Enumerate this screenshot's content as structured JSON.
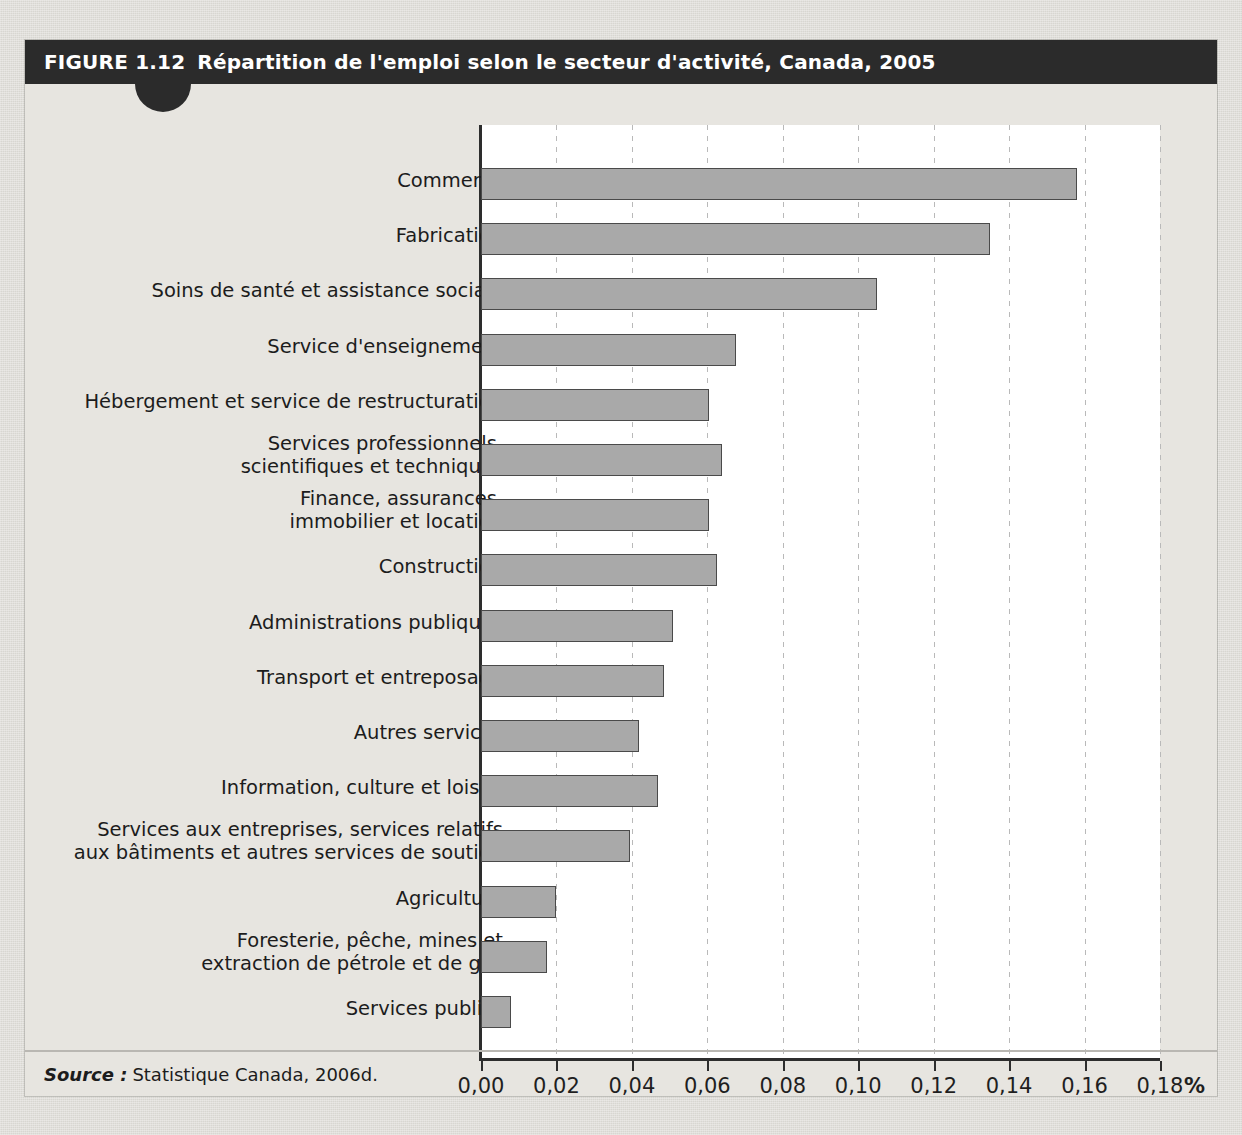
{
  "figure": {
    "number_label": "FIGURE 1.12",
    "title": "Répartition de l'emploi selon le secteur d'activité, Canada, 2005",
    "source_label": "Source :",
    "source_text": "Statistique Canada, 2006d.",
    "accent_color": "#2b2b2b",
    "bar_fill_color": "#a9a9a9",
    "bar_border_color": "#4a4a4a",
    "plot_background_color": "#ffffff",
    "page_background_color": "#dedcd7"
  },
  "chart_data": {
    "type": "bar",
    "orientation": "horizontal",
    "title": "Répartition de l'emploi selon le secteur d'activité, Canada, 2005",
    "xlabel": "%",
    "ylabel": "",
    "xlim": [
      0,
      0.18
    ],
    "grid": true,
    "legend": "none",
    "xticks": [
      0,
      0.02,
      0.04,
      0.06,
      0.08,
      0.1,
      0.12,
      0.14,
      0.16,
      0.18
    ],
    "xticklabels": [
      "0,00",
      "0,02",
      "0,04",
      "0,06",
      "0,08",
      "0,10",
      "0,12",
      "0,14",
      "0,16",
      "0,18"
    ],
    "categories": [
      "Commerce",
      "Fabrication",
      "Soins de santé et assistance sociale",
      "Service d'enseignement",
      "Hébergement et service de restructuration",
      "Services professionnels,\nscientifiques et techniques",
      "Finance, assurances,\nimmobilier et location",
      "Construction",
      "Administrations publiques",
      "Transport et entreposage",
      "Autres services",
      "Information, culture et loisirs",
      "Services aux entreprises, services relatifs\naux bâtiments et autres services de soutien",
      "Agriculture",
      "Foresterie, pêche, mines et\nextraction de pétrole et de gaz",
      "Services publics"
    ],
    "values": [
      0.158,
      0.135,
      0.105,
      0.0675,
      0.0605,
      0.064,
      0.0605,
      0.0625,
      0.051,
      0.0485,
      0.042,
      0.047,
      0.0395,
      0.0198,
      0.0175,
      0.008
    ]
  }
}
